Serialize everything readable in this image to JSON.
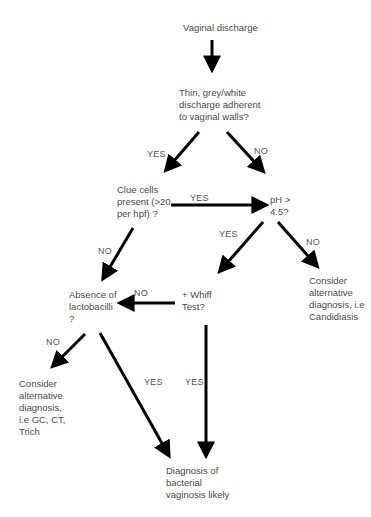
{
  "diagram": {
    "type": "flowchart",
    "nodes": {
      "start": "Vaginal discharge",
      "q_discharge": "Thin, grey/white\ndischarge adherent\nto vaginal walls?",
      "q_clue_cells": "Clue cells\npresent (>20\nper hpf) ?",
      "q_ph": "pH >\n4.5?",
      "alt_candidiasis": "Consider\nalternative\ndiagnosis, i.e\nCandidiasis",
      "q_whiff": "+ Whiff\nTest?",
      "q_lactobacilli": "Absence of\nlactobacilli\n?",
      "alt_gc_ct_trich": "Consider\nalternative\ndiagnosis,\ni.e GC, CT,\nTrich",
      "diagnosis_bv": "Diagnosis of\nbacterial\nvaginosis likely"
    },
    "edge_labels": {
      "discharge_yes": "YES",
      "discharge_no": "NO",
      "clue_yes": "YES",
      "clue_no": "NO",
      "ph_yes": "YES",
      "ph_no": "NO",
      "whiff_no": "NO",
      "whiff_yes": "YES",
      "lacto_no": "NO",
      "lacto_yes": "YES"
    },
    "edges": [
      {
        "from": "start",
        "to": "q_discharge",
        "label": ""
      },
      {
        "from": "q_discharge",
        "to": "q_clue_cells",
        "label": "YES"
      },
      {
        "from": "q_discharge",
        "to": "q_ph",
        "label": "NO"
      },
      {
        "from": "q_clue_cells",
        "to": "q_ph",
        "label": "YES"
      },
      {
        "from": "q_clue_cells",
        "to": "q_lactobacilli",
        "label": "NO"
      },
      {
        "from": "q_ph",
        "to": "q_whiff",
        "label": "YES"
      },
      {
        "from": "q_ph",
        "to": "alt_candidiasis",
        "label": "NO"
      },
      {
        "from": "q_whiff",
        "to": "q_lactobacilli",
        "label": "NO"
      },
      {
        "from": "q_whiff",
        "to": "diagnosis_bv",
        "label": "YES"
      },
      {
        "from": "q_lactobacilli",
        "to": "alt_gc_ct_trich",
        "label": "NO"
      },
      {
        "from": "q_lactobacilli",
        "to": "diagnosis_bv",
        "label": "YES"
      }
    ],
    "colors": {
      "arrow": "#000000",
      "text": "#4a4a4a",
      "background": "#ffffff"
    }
  }
}
